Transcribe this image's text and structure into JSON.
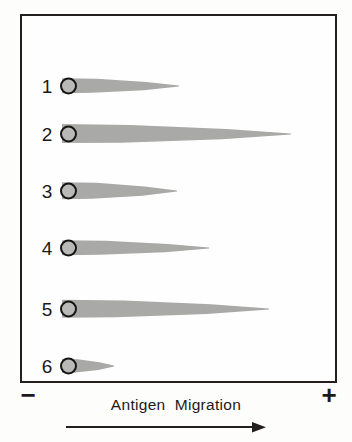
{
  "figure": {
    "caption": "Antigen  Migration",
    "cathode_symbol": "−",
    "anode_symbol": "+",
    "arrow_icon": "right-arrow"
  },
  "colors": {
    "ink": "#231f1e",
    "precipitin_fill": "#a9a9a7",
    "well_fill": "#b9b9b7",
    "background": "#ffffff"
  },
  "chart_data": {
    "type": "bar",
    "xlabel": "Antigen  Migration",
    "ylabel": "",
    "categories": [
      "1",
      "2",
      "3",
      "4",
      "5",
      "6"
    ],
    "values": [
      117,
      229,
      115,
      147,
      207,
      52
    ],
    "xlim": [
      0,
      297
    ],
    "grid": false,
    "legend": null,
    "annotations": [
      "−",
      "+"
    ]
  },
  "lanes": [
    {
      "label": "1",
      "rocket_length": 117,
      "rocket_height": 15,
      "top": 47
    },
    {
      "label": "2",
      "rocket_length": 229,
      "rocket_height": 19,
      "top": 95
    },
    {
      "label": "3",
      "rocket_length": 115,
      "rocket_height": 17,
      "top": 152
    },
    {
      "label": "4",
      "rocket_length": 147,
      "rocket_height": 15,
      "top": 209
    },
    {
      "label": "5",
      "rocket_length": 207,
      "rocket_height": 18,
      "top": 270
    },
    {
      "label": "6",
      "rocket_length": 52,
      "rocket_height": 14,
      "top": 327
    }
  ]
}
